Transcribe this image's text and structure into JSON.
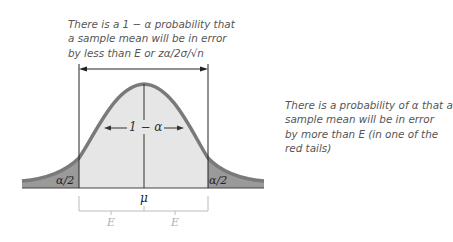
{
  "annotations": {
    "top_note": {
      "lines": [
        "There is a 1 − α probability that",
        "a sample mean will be in error",
        "by less than E or zα/2σ/√n"
      ]
    },
    "right_note": {
      "lines": [
        "There is a probability of α that a",
        "sample mean will be in error",
        "by more than E (in one of the",
        "red tails)"
      ]
    }
  },
  "curve_labels": {
    "center_area": "1 − α",
    "left_tail": "α/2",
    "right_tail": "α/2",
    "mean": "μ",
    "margin_left": "E",
    "margin_right": "E"
  },
  "colors": {
    "curve": "#7a7a7a",
    "center_fill": "#e6e6e6",
    "tail_fill": "#9a9a9a",
    "text": "#555555",
    "bracket": "#222222",
    "margin_text": "#b0b0b0"
  }
}
